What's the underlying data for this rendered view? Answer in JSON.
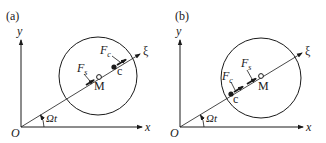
{
  "panels": [
    {
      "label": "(a)",
      "axis_x": "x",
      "axis_y": "y",
      "origin": "O",
      "rotating_axis": "ξ",
      "angle": "Ωt",
      "point_m": "M",
      "point_c": "c",
      "force_c": {
        "base": "F",
        "sub": "c"
      },
      "force_s": {
        "base": "F",
        "sub": "s"
      }
    },
    {
      "label": "(b)",
      "axis_x": "x",
      "axis_y": "y",
      "origin": "O",
      "rotating_axis": "ξ",
      "angle": "Ωt",
      "point_m": "M",
      "point_c": "c",
      "force_c": {
        "base": "F",
        "sub": "c"
      },
      "force_s": {
        "base": "F",
        "sub": "s"
      }
    }
  ],
  "colors": {
    "ink": "#1a1a1a",
    "background": "#ffffff"
  }
}
